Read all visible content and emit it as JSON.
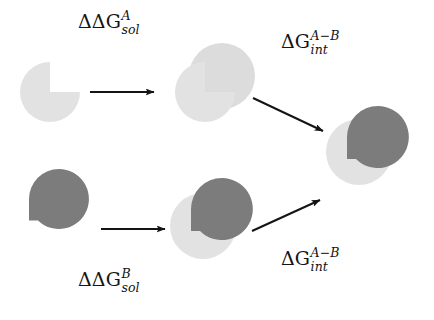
{
  "figure": {
    "width": 434,
    "height": 320,
    "background": "#ffffff"
  },
  "colors": {
    "light_gray": "#e2e2e2",
    "light_gray_alt": "#dcdcdc",
    "dark_gray": "#7c7c7c",
    "arrow": "#141414",
    "text": "#141414",
    "background": "#ffffff"
  },
  "labels": [
    {
      "id": "ddg-sol-a",
      "name": "label-ddg-sol-A",
      "base": "ΔΔG",
      "superscript": "A",
      "subscript": "sol",
      "full_text": "ΔΔG^A_sol",
      "x": 78,
      "y": 12
    },
    {
      "id": "dg-int-top",
      "name": "label-dg-int-top",
      "base": "ΔG",
      "superscript": "A−B",
      "subscript": "int",
      "full_text": "ΔG^(A−B)_int",
      "x": 281,
      "y": 32
    },
    {
      "id": "ddg-sol-b",
      "name": "label-ddg-sol-B",
      "base": "ΔΔG",
      "superscript": "B",
      "subscript": "sol",
      "full_text": "ΔΔG^B_sol",
      "x": 78,
      "y": 270
    },
    {
      "id": "dg-int-bottom",
      "name": "label-dg-int-bottom",
      "base": "ΔG",
      "superscript": "A−B",
      "subscript": "int",
      "full_text": "ΔG^(A−B)_int",
      "x": 281,
      "y": 249
    }
  ],
  "arrows": [
    {
      "id": "arrow-top-horizontal",
      "name": "arrow-top-horizontal",
      "from": [
        90,
        92
      ],
      "to": [
        154,
        92
      ],
      "direction": "right",
      "associated_label": "ddg-sol-a"
    },
    {
      "id": "arrow-top-diagonal",
      "name": "arrow-top-diagonal",
      "from": [
        253,
        98
      ],
      "to": [
        323,
        131
      ],
      "direction": "down-right",
      "associated_label": "dg-int-top"
    },
    {
      "id": "arrow-bottom-horizontal",
      "name": "arrow-bottom-horizontal",
      "from": [
        101,
        229
      ],
      "to": [
        165,
        229
      ],
      "direction": "right",
      "associated_label": "ddg-sol-b"
    },
    {
      "id": "arrow-bottom-diagonal",
      "name": "arrow-bottom-diagonal",
      "from": [
        252,
        231
      ],
      "to": [
        320,
        200
      ],
      "direction": "up-right",
      "associated_label": "dg-int-bottom"
    }
  ],
  "molecules": [
    {
      "id": "mol-A-free",
      "name": "molecule-A-free",
      "description": "ligand A alone with quarter notch (upper-right cut out)",
      "shape": "pac-man-notch-upper-right",
      "color": "#e2e2e2",
      "cx": 50,
      "cy": 92,
      "r": 30
    },
    {
      "id": "mol-A-complex",
      "name": "molecule-A-complex",
      "description": "ligand A notched circle paired with light receptor circle",
      "shape": "pair-light-light",
      "colors": [
        "#dcdcdc",
        "#e2e2e2"
      ],
      "cx": 205,
      "cy": 92
    },
    {
      "id": "mol-B-free",
      "name": "molecule-B-free",
      "description": "ligand B alone, dark teardrop with square lower-left corner",
      "shape": "teardrop-corner-lower-left",
      "color": "#7c7c7c",
      "cx": 59,
      "cy": 199,
      "r": 30
    },
    {
      "id": "mol-B-complex",
      "name": "molecule-B-complex",
      "description": "ligand B dark teardrop paired with light receptor circle",
      "shape": "pair-dark-light",
      "colors": [
        "#7c7c7c",
        "#e2e2e2"
      ],
      "cx": 212,
      "cy": 208
    },
    {
      "id": "mol-bound-final",
      "name": "molecule-bound-complex",
      "description": "final bound complex: dark ligand teardrop docked into light receptor circle",
      "shape": "pair-dark-light",
      "colors": [
        "#7c7c7c",
        "#e2e2e2"
      ],
      "cx": 375,
      "cy": 138
    }
  ]
}
